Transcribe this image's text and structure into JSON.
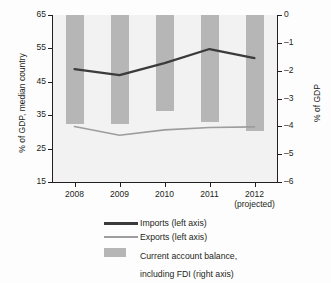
{
  "chart_data": {
    "type": "bar",
    "title": "",
    "subtitle": "",
    "xlabel": "",
    "categories": [
      "2008",
      "2009",
      "2010",
      "2011",
      "2012"
    ],
    "category_sublabels": [
      "",
      "",
      "",
      "",
      "(projected)"
    ],
    "left_axis": {
      "label": "% of GDP, median country",
      "ticks": [
        "65",
        "55",
        "45",
        "35",
        "25",
        "15"
      ],
      "tick_values": [
        65,
        55,
        45,
        35,
        25,
        15
      ],
      "ylim": [
        15,
        65
      ],
      "ylabel": "% of GDP, median country"
    },
    "right_axis": {
      "label": "% of GDP",
      "ticks": [
        "0",
        "–1",
        "–2",
        "–3",
        "–4",
        "–5",
        "–6"
      ],
      "tick_values": [
        0,
        -1,
        -2,
        -3,
        -4,
        -5,
        -6
      ],
      "ylim": [
        -6,
        0
      ],
      "ylabel": "% of GDP"
    },
    "grid": false,
    "legend_position": "bottom",
    "series": [
      {
        "name": "Imports (left axis)",
        "type": "line",
        "axis": "left",
        "color": "#3b3b3b",
        "values": [
          48.8,
          47.0,
          50.6,
          54.8,
          52.1
        ]
      },
      {
        "name": "Exports (left axis)",
        "type": "line",
        "axis": "left",
        "color": "#9d9d9d",
        "values": [
          31.6,
          29.0,
          30.6,
          31.3,
          31.5
        ]
      },
      {
        "name": "Current account balance, including FDI (right axis)",
        "type": "bar",
        "axis": "right",
        "color": "#b6b6b6",
        "values": [
          -3.9,
          -3.9,
          -3.45,
          -3.85,
          -4.15
        ]
      }
    ]
  },
  "legend": {
    "items": [
      {
        "label": "Imports (left axis)",
        "label2": "",
        "marker": "line-dark"
      },
      {
        "label": "Exports (left axis)",
        "label2": "",
        "marker": "line-light"
      },
      {
        "label": "Current account balance,",
        "label2": "including FDI (right axis)",
        "marker": "swatch"
      }
    ]
  }
}
